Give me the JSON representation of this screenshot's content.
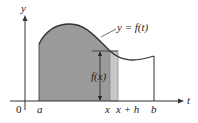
{
  "diagram": {
    "axes": {
      "x_label": "t",
      "y_label": "y",
      "origin_label": "0"
    },
    "curve_label": "y = f(t)",
    "tick_labels": {
      "a": "a",
      "x": "x",
      "x_plus_h": "x + h",
      "b": "b"
    },
    "height_label": "f(x)",
    "colors": {
      "area_fill": "#9a9a9a",
      "strip_fill": "#c8c8c8",
      "curve": "#333333",
      "axis": "#333333"
    }
  }
}
